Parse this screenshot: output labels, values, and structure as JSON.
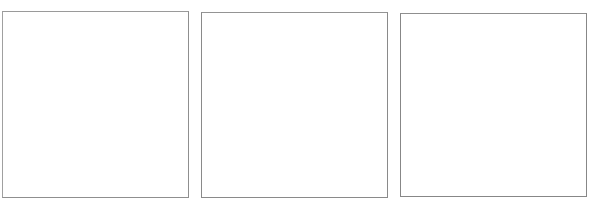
{
  "page": {
    "background_color": "#ffffff",
    "width": 595,
    "height": 208
  },
  "panels": [
    {
      "id": "panel-1",
      "label": "",
      "content": "",
      "border_color": "#8f8f8f",
      "fill_color": "#ffffff",
      "x": 2,
      "y": 11,
      "width": 187,
      "height": 187
    },
    {
      "id": "panel-2",
      "label": "",
      "content": "",
      "border_color": "#8a8a8a",
      "fill_color": "#ffffff",
      "x": 201,
      "y": 12,
      "width": 187,
      "height": 186
    },
    {
      "id": "panel-3",
      "label": "",
      "content": "",
      "border_color": "#878787",
      "fill_color": "#ffffff",
      "x": 400,
      "y": 13,
      "width": 187,
      "height": 184
    }
  ]
}
